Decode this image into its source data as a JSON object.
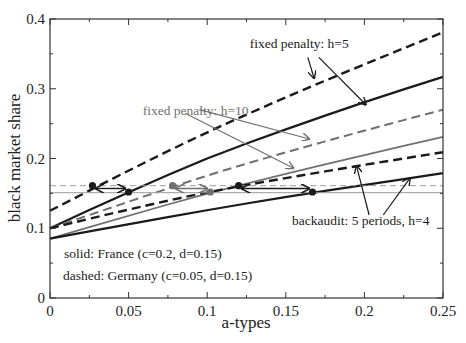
{
  "chart_data": {
    "type": "line",
    "title": "",
    "xlabel": "a-types",
    "ylabel": "black market share",
    "xlim": [
      0,
      0.25
    ],
    "ylim": [
      0,
      0.4
    ],
    "xticks": [
      "0",
      "0.05",
      "0.1",
      "0.15",
      "0.2",
      "0.25"
    ],
    "yticks": [
      "0",
      "0.1",
      "0.2",
      "0.3",
      "0.4"
    ],
    "grid": false,
    "legend_text": [
      "solid: France (c=0.2, d=0.15)",
      "dashed: Germany (c=0.05, d=0.15)"
    ],
    "series": [
      {
        "name": "Germany fixed penalty h=5",
        "style": "dashed",
        "color": "#1a1a1a",
        "width": 2.4,
        "x": [
          0,
          0.05,
          0.1,
          0.15,
          0.2,
          0.25
        ],
        "values": [
          0.125,
          0.183,
          0.238,
          0.288,
          0.335,
          0.381
        ]
      },
      {
        "name": "France fixed penalty h=5",
        "style": "solid",
        "color": "#1a1a1a",
        "width": 2.2,
        "x": [
          0,
          0.05,
          0.1,
          0.15,
          0.2,
          0.25
        ],
        "values": [
          0.1,
          0.152,
          0.201,
          0.242,
          0.281,
          0.317
        ]
      },
      {
        "name": "Germany fixed penalty h=10",
        "style": "dashed",
        "color": "#707070",
        "width": 2.0,
        "x": [
          0,
          0.05,
          0.1,
          0.15,
          0.2,
          0.25
        ],
        "values": [
          0.1,
          0.138,
          0.176,
          0.209,
          0.24,
          0.27
        ]
      },
      {
        "name": "France fixed penalty h=10",
        "style": "solid",
        "color": "#707070",
        "width": 1.8,
        "x": [
          0,
          0.05,
          0.1,
          0.15,
          0.2,
          0.25
        ],
        "values": [
          0.085,
          0.118,
          0.15,
          0.178,
          0.205,
          0.231
        ]
      },
      {
        "name": "Germany backaudit 5 periods h=4",
        "style": "dashed",
        "color": "#1a1a1a",
        "width": 2.4,
        "x": [
          0,
          0.05,
          0.1,
          0.15,
          0.2,
          0.25
        ],
        "values": [
          0.1,
          0.127,
          0.152,
          0.172,
          0.191,
          0.209
        ]
      },
      {
        "name": "France backaudit 5 periods h=4",
        "style": "solid",
        "color": "#1a1a1a",
        "width": 2.2,
        "x": [
          0,
          0.05,
          0.1,
          0.15,
          0.2,
          0.25
        ],
        "values": [
          0.085,
          0.106,
          0.126,
          0.145,
          0.162,
          0.179
        ]
      },
      {
        "name": "Germany reference level",
        "style": "dashed-thin",
        "color": "#999999",
        "width": 1.0,
        "x": [
          0,
          0.25
        ],
        "values": [
          0.161,
          0.161
        ]
      },
      {
        "name": "France reference level",
        "style": "solid-thin",
        "color": "#999999",
        "width": 1.0,
        "x": [
          0,
          0.25
        ],
        "values": [
          0.151,
          0.151
        ]
      }
    ],
    "markers": [
      {
        "x": 0.027,
        "y": 0.161,
        "color": "#1a1a1a"
      },
      {
        "x": 0.05,
        "y": 0.152,
        "color": "#1a1a1a"
      },
      {
        "x": 0.078,
        "y": 0.161,
        "color": "#707070"
      },
      {
        "x": 0.102,
        "y": 0.152,
        "color": "#707070"
      },
      {
        "x": 0.12,
        "y": 0.161,
        "color": "#1a1a1a"
      },
      {
        "x": 0.167,
        "y": 0.152,
        "color": "#1a1a1a"
      }
    ],
    "double_arrows": [
      {
        "x1": 0.029,
        "x2": 0.048,
        "y": 0.157,
        "color": "#1a1a1a"
      },
      {
        "x1": 0.08,
        "x2": 0.1,
        "y": 0.157,
        "color": "#707070"
      },
      {
        "x1": 0.122,
        "x2": 0.165,
        "y": 0.157,
        "color": "#1a1a1a"
      }
    ],
    "annotations": [
      {
        "text": "fixed penalty: h=5",
        "color": "#1a1a1a",
        "x": 0.127,
        "y": 0.358,
        "arrows": [
          [
            0.164,
            0.345,
            0.168,
            0.315
          ],
          [
            0.171,
            0.345,
            0.201,
            0.277
          ]
        ]
      },
      {
        "text": "fixed penalty: h=10",
        "color": "#707070",
        "x": 0.059,
        "y": 0.262,
        "arrows": [
          [
            0.095,
            0.27,
            0.165,
            0.228
          ],
          [
            0.086,
            0.265,
            0.155,
            0.186
          ]
        ]
      },
      {
        "text": "backaudit: 5 periods, h=4",
        "color": "#1a1a1a",
        "x": 0.154,
        "y": 0.105,
        "arrows": [
          [
            0.203,
            0.119,
            0.195,
            0.189
          ],
          [
            0.212,
            0.119,
            0.229,
            0.172
          ]
        ]
      }
    ]
  }
}
